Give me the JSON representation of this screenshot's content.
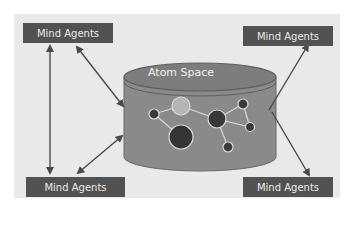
{
  "diagram": {
    "central_store": {
      "label": "Atom Space"
    },
    "agents": [
      {
        "id": "top-left",
        "label": "Mind Agents"
      },
      {
        "id": "top-right",
        "label": "Mind Agents"
      },
      {
        "id": "bottom-left",
        "label": "Mind Agents"
      },
      {
        "id": "bottom-right",
        "label": "Mind Agents"
      }
    ],
    "connections": [
      {
        "from": "top-left",
        "to": "bottom-left",
        "type": "bidirectional"
      },
      {
        "from": "top-left",
        "to": "Atom Space",
        "type": "bidirectional"
      },
      {
        "from": "bottom-left",
        "to": "Atom Space",
        "type": "bidirectional"
      },
      {
        "from": "Atom Space",
        "to": "top-right",
        "type": "directed"
      },
      {
        "from": "Atom Space",
        "to": "bottom-right",
        "type": "directed"
      }
    ],
    "colors": {
      "panel": "#e9e9e9",
      "agent_box": "#525252",
      "cylinder": "#8a8a8a",
      "node_dark": "#3a3a3a",
      "node_light": "#b5b5b5",
      "arrow": "#4a4a4a"
    }
  }
}
